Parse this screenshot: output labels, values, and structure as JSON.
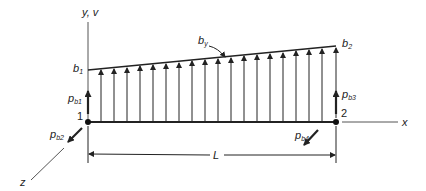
{
  "figure": {
    "type": "beam element with linearly varying distributed body force",
    "axes": {
      "y_label": "y, v",
      "x_label": "x",
      "z_label": "z"
    },
    "nodes": [
      {
        "id": "1",
        "label": "1"
      },
      {
        "id": "2",
        "label": "2"
      }
    ],
    "distributed_load": {
      "label_main": "b",
      "label_main_sub": "y",
      "start_label": "b",
      "start_label_sub": "1",
      "end_label": "b",
      "end_label_sub": "2",
      "arrow_count": 18
    },
    "nodal_forces": [
      {
        "main": "p",
        "sub": "b1",
        "node": "1",
        "direction": "+y"
      },
      {
        "main": "p",
        "sub": "b2",
        "node": "1",
        "direction": "+z"
      },
      {
        "main": "p",
        "sub": "b3",
        "node": "2",
        "direction": "+y"
      },
      {
        "main": "p",
        "sub": "b4",
        "node": "2",
        "direction": "+z"
      }
    ],
    "dimension": {
      "label": "L"
    },
    "colors": {
      "line": "#222222",
      "axis": "#555555",
      "background": "#ffffff"
    }
  }
}
